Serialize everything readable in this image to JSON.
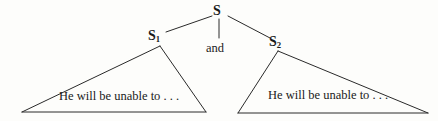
{
  "diagram": {
    "kind": "syntax-tree",
    "line_color": "#2a2a2a",
    "text_color": "#1a1a1a",
    "background_color": "#fdfdfb"
  },
  "nodes": {
    "root": {
      "label": "S",
      "subscript": ""
    },
    "left_clause": {
      "label": "S",
      "subscript": "1"
    },
    "right_clause": {
      "label": "S",
      "subscript": "2"
    },
    "conjunction": {
      "label": "and"
    }
  },
  "triangles": {
    "left": {
      "text": "He will be unable to . . ."
    },
    "right": {
      "text": "He will be unable to . . ."
    }
  }
}
